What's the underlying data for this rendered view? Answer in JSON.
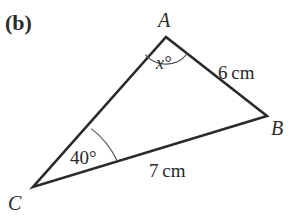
{
  "figure": {
    "part_label": "(b)",
    "colors": {
      "line": "#2a2a2a",
      "arc": "#555555",
      "text": "#2a2a2a",
      "background": "#ffffff"
    }
  },
  "triangle": {
    "vertices": [
      {
        "name": "A",
        "x": 166,
        "y": 37
      },
      {
        "name": "B",
        "x": 267,
        "y": 116
      },
      {
        "name": "C",
        "x": 33,
        "y": 187
      }
    ],
    "sides": [
      {
        "from": "A",
        "to": "B",
        "label": "6 cm"
      },
      {
        "from": "C",
        "to": "B",
        "label": "7 cm"
      },
      {
        "from": "C",
        "to": "A",
        "label": ""
      }
    ],
    "angles": [
      {
        "vertex": "A",
        "label": "x°"
      },
      {
        "vertex": "C",
        "label": "40°"
      }
    ]
  }
}
